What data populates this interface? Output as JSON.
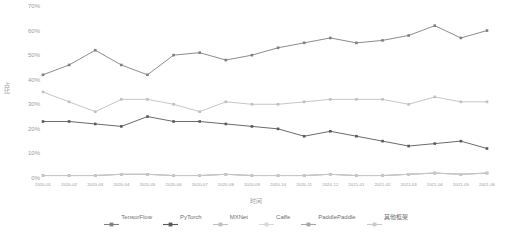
{
  "chart_data": {
    "type": "line",
    "title": "",
    "xlabel": "时间",
    "ylabel": "占比",
    "ylim": [
      0,
      70
    ],
    "yticks": [
      "0%",
      "10%",
      "20%",
      "30%",
      "40%",
      "50%",
      "60%",
      "70%"
    ],
    "ytick_values": [
      0,
      10,
      20,
      30,
      40,
      50,
      60,
      70
    ],
    "grid": false,
    "legend_position": "bottom",
    "categories": [
      "2020-01",
      "2020-02",
      "2020-03",
      "2020-04",
      "2020-05",
      "2020-06",
      "2020-07",
      "2020-08",
      "2020-09",
      "2020-10",
      "2020-11",
      "2020-12",
      "2021-01",
      "2021-02",
      "2021-03",
      "2021-04",
      "2021-05",
      "2021-06"
    ],
    "series": [
      {
        "name": "TensorFlow",
        "color": "#7f7f7f",
        "values": [
          42,
          46,
          52,
          46,
          42,
          50,
          51,
          48,
          50,
          53,
          55,
          57,
          55,
          56,
          58,
          62,
          57,
          60
        ]
      },
      {
        "name": "PyTorch",
        "color": "#595959",
        "values": [
          23,
          23,
          22,
          21,
          25,
          23,
          23,
          22,
          21,
          20,
          17,
          19,
          17,
          15,
          13,
          14,
          15,
          12
        ]
      },
      {
        "name": "MXNet",
        "color": "#bfbfbf",
        "values": [
          35,
          31,
          27,
          32,
          32,
          30,
          27,
          31,
          30,
          30,
          31,
          32,
          32,
          32,
          30,
          33,
          31,
          31
        ]
      },
      {
        "name": "Caffe",
        "color": "#d9d9d9",
        "values": [
          1,
          1,
          1,
          1.5,
          1.5,
          1,
          1,
          1.5,
          1,
          1,
          1,
          1.5,
          1,
          1,
          1.5,
          2,
          1.5,
          2
        ]
      },
      {
        "name": "PaddlePaddle",
        "color": "#a6a6a6",
        "values": [
          1,
          1,
          1,
          1.5,
          1.5,
          1,
          1,
          1.5,
          1,
          1,
          1,
          1.5,
          1,
          1,
          1.5,
          2,
          1.5,
          2
        ]
      },
      {
        "name": "其他框架",
        "color": "#c9c9c9",
        "values": [
          1,
          1,
          1,
          1.5,
          1.5,
          1,
          1,
          1.5,
          1,
          1,
          1,
          1.5,
          1,
          1,
          1.5,
          2,
          1.5,
          2
        ]
      }
    ]
  },
  "axis": {
    "y_title": "占比",
    "x_title": "时间"
  }
}
